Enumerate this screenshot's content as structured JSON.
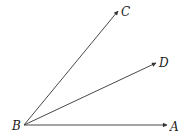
{
  "diagram": {
    "type": "angle-rays",
    "vertex": {
      "label": "B",
      "x": 24,
      "y": 125
    },
    "rays": [
      {
        "label": "A",
        "tip": {
          "x": 167,
          "y": 125
        }
      },
      {
        "label": "C",
        "tip": {
          "x": 118,
          "y": 11
        }
      },
      {
        "label": "D",
        "tip": {
          "x": 156,
          "y": 63
        }
      }
    ],
    "colors": {
      "stroke": "#333333",
      "text": "#222222",
      "background": "#ffffff"
    }
  }
}
